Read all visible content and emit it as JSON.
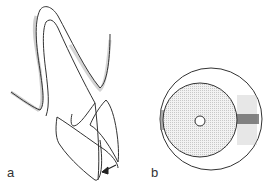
{
  "figure": {
    "panels": [
      {
        "label": "a",
        "description": "tooth outline with root and crown, arrow"
      },
      {
        "label": "b",
        "description": "concentric circles cross-section with central hole"
      }
    ]
  }
}
